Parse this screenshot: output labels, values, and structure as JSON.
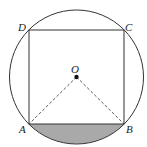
{
  "diagram": {
    "type": "geometry",
    "labels": {
      "A": "A",
      "B": "B",
      "C": "C",
      "D": "D",
      "O": "O"
    },
    "colors": {
      "stroke": "#333333",
      "shade": "#a9a9a9",
      "dashed": "#333333"
    }
  }
}
